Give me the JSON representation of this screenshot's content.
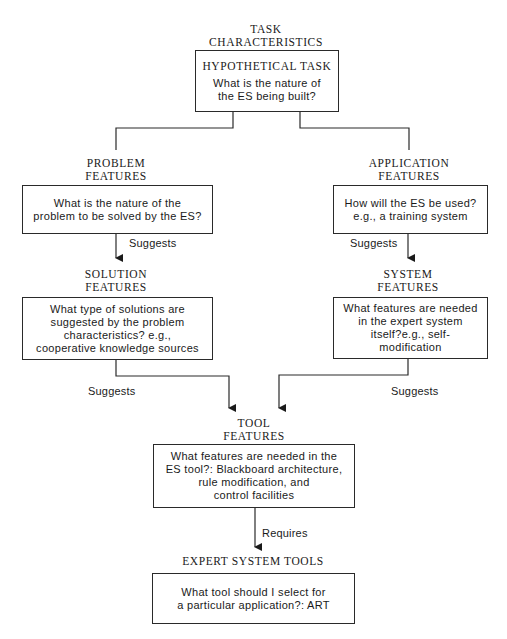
{
  "diagram": {
    "task": {
      "heading": "TASK\nCHARACTERISTICS",
      "title": "HYPOTHETICAL TASK",
      "question": "What is the nature of\nthe ES being built?"
    },
    "problem": {
      "heading": "PROBLEM\nFEATURES",
      "question": "What is the nature of the\nproblem to be solved by the ES?"
    },
    "application": {
      "heading": "APPLICATION\nFEATURES",
      "question": "How will the ES be used?\ne.g., a training system"
    },
    "solution": {
      "heading": "SOLUTION\nFEATURES",
      "question": "What type of solutions are\nsuggested by the problem\ncharacteristics? e.g.,\ncooperative knowledge sources"
    },
    "system": {
      "heading": "SYSTEM\nFEATURES",
      "question": "What features are needed\nin the expert system\nitself?e.g., self-\nmodification"
    },
    "tool": {
      "heading": "TOOL\nFEATURES",
      "question": "What features are needed in the\nES tool?: Blackboard architecture,\nrule modification, and\ncontrol facilities"
    },
    "expert_tools": {
      "heading": "EXPERT SYSTEM TOOLS",
      "question": "What tool should I select for\na particular application?: ART"
    },
    "edges": {
      "problem_to_solution": "Suggests",
      "application_to_system": "Suggests",
      "solution_to_tool": "Suggests",
      "system_to_tool": "Suggests",
      "tool_to_expert_tools": "Requires"
    }
  }
}
